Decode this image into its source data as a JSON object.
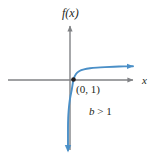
{
  "figure": {
    "name": "exponential-logarithmic-graph",
    "background_color": "#ffffff",
    "axis_color": "#808285",
    "curve_color": "#4a8fc7",
    "text_color": "#231f20",
    "point_color": "#231f20"
  },
  "labels": {
    "y_axis": "f(x)",
    "x_axis": "x",
    "point": "(0, 1)",
    "condition_base": "b",
    "condition_rel": " > ",
    "condition_value": "1",
    "condition_full": "b > 1"
  },
  "chart_data": {
    "type": "line",
    "title": "",
    "subtitle": "",
    "xlabel": "x",
    "ylabel": "f(x)",
    "grid": false,
    "legend": null,
    "axis_style": "arrowed-cartesian",
    "origin_px": [
      70,
      80
    ],
    "xlim_px": [
      8,
      135
    ],
    "ylim_px": [
      24,
      150
    ],
    "annotations": [
      {
        "text": "(0, 1)",
        "x_px": 76,
        "y_px": 84,
        "kind": "point-label"
      },
      {
        "text": "b > 1",
        "x_px": 89,
        "y_px": 106,
        "kind": "condition-label"
      },
      {
        "text": "f(x)",
        "x_px": 62,
        "y_px": 7,
        "kind": "axis-label"
      },
      {
        "text": "x",
        "x_px": 142,
        "y_px": 75,
        "kind": "axis-label"
      }
    ],
    "marked_points": [
      {
        "label": "(0, 1)",
        "x_px": 73.5,
        "y_px": 79.5
      }
    ],
    "series": [
      {
        "name": "log-curve",
        "color": "#4a8fc7",
        "arrow_start": true,
        "arrow_end": true,
        "points_px": [
          [
            68.0,
            150.0
          ],
          [
            68.0,
            128.0
          ],
          [
            68.2,
            118.0
          ],
          [
            68.7,
            110.0
          ],
          [
            69.4,
            103.0
          ],
          [
            70.4,
            96.5
          ],
          [
            71.7,
            90.0
          ],
          [
            73.5,
            79.5
          ],
          [
            76.0,
            74.0
          ],
          [
            79.5,
            71.0
          ],
          [
            84.0,
            69.4
          ],
          [
            90.0,
            68.3
          ],
          [
            97.0,
            67.6
          ],
          [
            105.0,
            67.1
          ],
          [
            114.0,
            66.7
          ],
          [
            124.0,
            66.4
          ],
          [
            133.0,
            66.2
          ]
        ]
      }
    ]
  }
}
